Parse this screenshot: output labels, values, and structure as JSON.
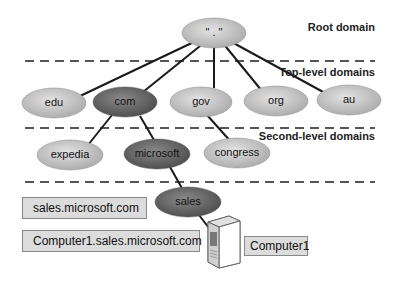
{
  "levels": [
    {
      "label": "Root domain"
    },
    {
      "label": "Top-level domains"
    },
    {
      "label": "Second-level domains"
    }
  ],
  "root": {
    "label": "\" . \""
  },
  "top_level": [
    {
      "label": "edu",
      "highlight": false
    },
    {
      "label": "com",
      "highlight": true
    },
    {
      "label": "gov",
      "highlight": false
    },
    {
      "label": "org",
      "highlight": false
    },
    {
      "label": "au",
      "highlight": false
    }
  ],
  "second_level": [
    {
      "label": "expedia",
      "highlight": false
    },
    {
      "label": "microsoft",
      "highlight": true
    },
    {
      "label": "congress",
      "highlight": false
    }
  ],
  "subdomain": {
    "label": "sales"
  },
  "fqdn_labels": {
    "domain": "sales.microsoft.com",
    "host": "Computer1.sales.microsoft.com",
    "computer": "Computer1"
  },
  "colors": {
    "light_node": "#c4c4c4",
    "dark_node": "#707070",
    "line": "#1a1a1a",
    "divider": "#555555",
    "box_fill": "#dcdcdc"
  }
}
